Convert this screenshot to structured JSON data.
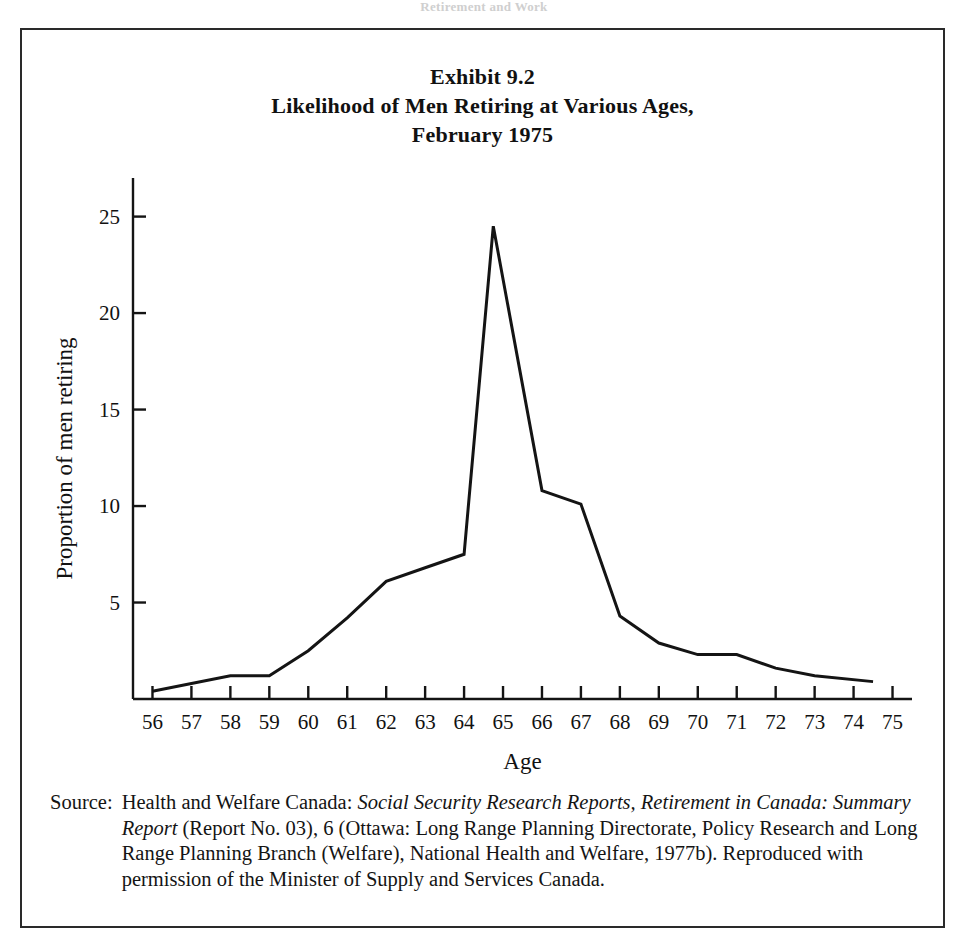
{
  "page": {
    "running_head": "Retirement and Work"
  },
  "exhibit": {
    "number_line": "Exhibit 9.2",
    "title_line": "Likelihood of Men Retiring at Various Ages,",
    "date_line": "February 1975"
  },
  "source": {
    "label": "Source:",
    "part1": "Health and Welfare Canada: ",
    "italic1": "Social Security Research Reports, Retirement in Canada: Summary Report",
    "part2": " (Report No. 03), 6 (Ottawa: Long Range Planning Directorate, Policy Research and Long Range Planning Branch (Welfare), National Health and Welfare, 1977b). Reproduced with permission of the Minister of Supply and Services Canada.",
    "full_text": "Source: Health and Welfare Canada: Social Security Research Reports, Retirement in Canada: Summary Report (Report No. 03), 6 (Ottawa: Long Range Planning Directorate, Policy Research and Long Range Planning Branch (Welfare), National Health and Welfare, 1977b). Reproduced with permission of the Minister of Supply and Services Canada."
  },
  "chart_data": {
    "type": "line",
    "title": "Exhibit 9.2 Likelihood of Men Retiring at Various Ages, February 1975",
    "xlabel": "Age",
    "ylabel": "Proportion of men retiring",
    "x": [
      56,
      57,
      58,
      59,
      60,
      61,
      62,
      63,
      64,
      64.75,
      66,
      67,
      68,
      69,
      70,
      71,
      72,
      73,
      74.5
    ],
    "values": [
      0.4,
      0.8,
      1.2,
      1.2,
      2.5,
      4.2,
      6.1,
      6.8,
      7.5,
      24.5,
      10.8,
      10.1,
      4.3,
      2.9,
      2.3,
      2.3,
      1.6,
      1.2,
      0.9
    ],
    "xtick_labels": [
      "56",
      "57",
      "58",
      "59",
      "60",
      "61",
      "62",
      "63",
      "64",
      "65",
      "66",
      "67",
      "68",
      "69",
      "70",
      "71",
      "72",
      "73",
      "74",
      "75"
    ],
    "xtick_values": [
      56,
      57,
      58,
      59,
      60,
      61,
      62,
      63,
      64,
      65,
      66,
      67,
      68,
      69,
      70,
      71,
      72,
      73,
      74,
      75
    ],
    "ytick_labels": [
      "5",
      "10",
      "15",
      "20",
      "25"
    ],
    "ytick_values": [
      5,
      10,
      15,
      20,
      25
    ],
    "xlim": [
      55.5,
      75.5
    ],
    "ylim": [
      0,
      27
    ],
    "grid": false,
    "legend": false,
    "line_color": "#141414",
    "axis_color": "#141414"
  }
}
